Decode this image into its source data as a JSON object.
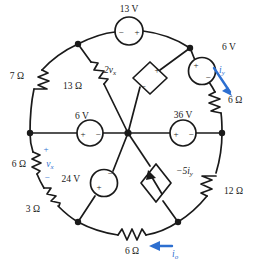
{
  "figure": {
    "type": "circuit-schematic",
    "stroke_color": "#1a1a1a",
    "highlight_color": "#2d6fd0"
  },
  "components": {
    "resistors": [
      {
        "id": "r-7ohm",
        "label": "7 Ω",
        "position": "outer-ring-upper-left"
      },
      {
        "id": "r-13ohm",
        "label": "13 Ω",
        "position": "spoke-upper-left"
      },
      {
        "id": "r-6ohm-right",
        "label": "6 Ω",
        "position": "outer-ring-upper-right"
      },
      {
        "id": "r-6ohm-left",
        "label": "6 Ω",
        "position": "outer-ring-left"
      },
      {
        "id": "r-3ohm",
        "label": "3 Ω",
        "position": "outer-ring-lower-left"
      },
      {
        "id": "r-12ohm",
        "label": "12 Ω",
        "position": "outer-ring-lower-right"
      },
      {
        "id": "r-6ohm-bottom",
        "label": "6 Ω",
        "position": "outer-ring-bottom"
      }
    ],
    "voltage_sources": [
      {
        "id": "v-13",
        "label": "13 V",
        "plus": "right",
        "minus": "left",
        "position": "outer-ring-top"
      },
      {
        "id": "v-6-topright",
        "label": "6 V",
        "plus": "upper-left",
        "minus": "lower-right",
        "position": "outer-ring-upper-right"
      },
      {
        "id": "v-6-left",
        "label": "6 V",
        "plus": "left",
        "minus": "right",
        "position": "spoke-left"
      },
      {
        "id": "v-36",
        "label": "36 V",
        "plus": "left",
        "minus": "right",
        "position": "spoke-right"
      },
      {
        "id": "v-24",
        "label": "24 V",
        "plus": "lower-left",
        "minus": "upper-right",
        "position": "spoke-lower-left"
      }
    ],
    "dependent_sources": [
      {
        "id": "dep-2vx",
        "label": "2v",
        "subscript": "x",
        "kind": "voltage",
        "position": "spoke-upper-right"
      },
      {
        "id": "dep-5iy",
        "label": "−5i",
        "subscript": "y",
        "kind": "current",
        "position": "spoke-lower-right"
      }
    ],
    "variables": [
      {
        "id": "var-vx",
        "label": "v",
        "subscript": "x",
        "plus": "+",
        "minus": "−",
        "color": "#2d6fd0",
        "across": "r-6ohm-left"
      },
      {
        "id": "var-iy",
        "label": "i",
        "subscript": "y",
        "color": "#2d6fd0",
        "direction": "down-right",
        "through": "r-6ohm-right"
      },
      {
        "id": "var-io",
        "label": "i",
        "subscript": "o",
        "color": "#2d6fd0",
        "direction": "left",
        "through": "r-6ohm-bottom"
      }
    ]
  }
}
